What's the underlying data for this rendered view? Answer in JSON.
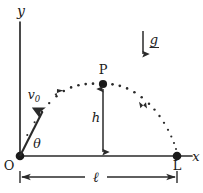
{
  "figure": {
    "ink_color": "#2a2a2a",
    "background_color": "#ffffff",
    "axes": {
      "y_axis_label": "y",
      "x_axis_label": "x",
      "origin_label": "O"
    },
    "points": {
      "origin": {
        "label": "O",
        "x": 20,
        "y": 156
      },
      "apex": {
        "label": "P",
        "x": 103,
        "y": 84
      },
      "landing": {
        "label": "L",
        "x": 177,
        "y": 156
      }
    },
    "labels": {
      "initial_velocity": "v",
      "initial_velocity_subscript": "0",
      "launch_angle": "θ",
      "height": "h",
      "range": "ℓ",
      "gravity": "g"
    },
    "geometry": {
      "y_axis_top": 22,
      "x_axis_right": 192,
      "dimension_line_y": 177,
      "velocity_arrow_from_x": 20,
      "velocity_arrow_from_y": 156,
      "velocity_arrow_to_x": 42,
      "velocity_arrow_to_y": 112,
      "gravity_arrow_x": 143,
      "gravity_arrow_top_y": 32,
      "gravity_arrow_bottom_y": 58
    },
    "trajectory": {
      "style": "dotted",
      "direction_markers": 2,
      "dot_count": 26,
      "start_x": 20,
      "end_x": 177,
      "apex_x": 103,
      "apex_y": 84,
      "baseline_y": 156
    }
  }
}
